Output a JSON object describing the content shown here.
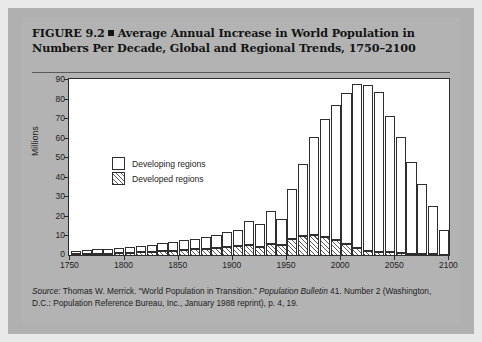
{
  "figure": {
    "title_line1": "FIGURE 9.2",
    "title_line2": "Average Annual Increase in World Population in Numbers Per Decade, Global and Regional Trends, 1750–2100",
    "source_prefix": "Source:",
    "source_line": " Thomas W. Merrick. “World Population in Transition.” ",
    "source_italic": "Population Bulletin",
    "source_rest": " 41. Number 2 (Washington, D.C.: Population Reference Bureau, Inc., January 1988 reprint), p. 4, 19."
  },
  "chart_data": {
    "type": "bar",
    "stacked": true,
    "title": "Average Annual Increase in World Population in Numbers Per Decade, Global and Regional Trends, 1750–2100",
    "xlabel": "",
    "ylabel": "Millions",
    "ylim": [
      0,
      90
    ],
    "yticks": [
      0,
      10,
      20,
      30,
      40,
      50,
      60,
      70,
      80,
      90
    ],
    "xlim": [
      1750,
      2100
    ],
    "xticks": [
      1750,
      1800,
      1850,
      1900,
      1950,
      2000,
      2050,
      2100
    ],
    "grid": false,
    "legend_position": "upper-left",
    "categories": [
      1750,
      1760,
      1770,
      1780,
      1790,
      1800,
      1810,
      1820,
      1830,
      1840,
      1850,
      1860,
      1870,
      1880,
      1890,
      1900,
      1910,
      1920,
      1930,
      1940,
      1950,
      1960,
      1970,
      1980,
      1990,
      2000,
      2010,
      2020,
      2030,
      2040,
      2050,
      2060,
      2070,
      2080,
      2090
    ],
    "series": [
      {
        "name": "Developed regions",
        "fill": "hatched",
        "values": [
          0.6,
          0.7,
          0.9,
          1.0,
          1.2,
          1.4,
          1.6,
          1.9,
          2.2,
          2.5,
          2.8,
          3.2,
          3.6,
          4.0,
          4.5,
          5.0,
          5.3,
          4.6,
          6.0,
          5.2,
          8.5,
          10.0,
          10.5,
          9.5,
          8.0,
          6.0,
          4.0,
          2.6,
          2.0,
          1.6,
          1.2,
          1.0,
          0.8,
          0.6,
          0.5
        ]
      },
      {
        "name": "Developing regions",
        "fill": "white",
        "values": [
          2.0,
          2.1,
          2.4,
          2.6,
          2.9,
          3.2,
          3.5,
          3.8,
          4.2,
          4.6,
          5.0,
          5.4,
          6.0,
          6.6,
          7.4,
          8.3,
          12.5,
          11.4,
          17.0,
          13.8,
          25.5,
          37.0,
          50.5,
          61.0,
          69.5,
          77.5,
          84.0,
          85.0,
          82.0,
          70.0,
          60.0,
          47.0,
          36.0,
          25.0,
          12.5
        ]
      }
    ],
    "totals": [
      2.6,
      2.8,
      3.3,
      3.6,
      4.1,
      4.6,
      5.1,
      5.7,
      6.4,
      7.1,
      7.8,
      8.6,
      9.6,
      10.6,
      11.9,
      13.3,
      17.8,
      16.0,
      23.0,
      19.0,
      34.0,
      47.0,
      61.0,
      70.5,
      77.5,
      83.5,
      88.0,
      87.6,
      84.0,
      71.6,
      61.2,
      48.0,
      36.8,
      25.6,
      13.0
    ]
  },
  "legend": {
    "items": [
      {
        "label": "Developing regions",
        "fill": "white"
      },
      {
        "label": "Developed regions",
        "fill": "hatched"
      }
    ]
  }
}
